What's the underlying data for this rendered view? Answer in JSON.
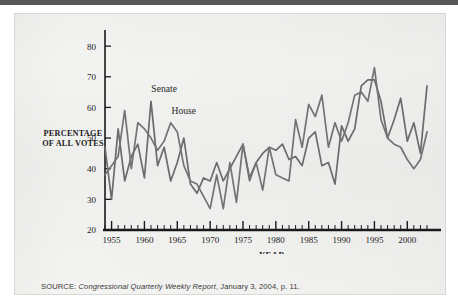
{
  "figure": {
    "y_axis_label_line1": "PERCENTAGE",
    "y_axis_label_line2": "OF ALL VOTES",
    "x_axis_title": "YEAR",
    "source_label": "SOURCE:",
    "source_publication": "Congressional Quarterly Weekly Report",
    "source_rest": ", January 3, 2004, p. 11.",
    "colors": {
      "senate_line": "#6b6b6b",
      "house_line": "#737373",
      "axis": "#1b1b1b",
      "paper": "#f3f3f1",
      "top_bar": "#575757"
    }
  },
  "chart_data": {
    "type": "line",
    "title": "",
    "xlabel": "YEAR",
    "ylabel": "PERCENTAGE OF ALL VOTES",
    "xlim": [
      1954,
      2003
    ],
    "ylim": [
      20,
      82
    ],
    "yticks": [
      20,
      30,
      40,
      50,
      60,
      70,
      80
    ],
    "xticks": [
      1955,
      1960,
      1965,
      1970,
      1975,
      1980,
      1985,
      1990,
      1995,
      2000
    ],
    "minor_xtick_interval": 1,
    "grid": false,
    "legend": "inline-labels",
    "annotations": [
      {
        "text": "Senate",
        "x": 1963,
        "y": 65
      },
      {
        "text": "House",
        "x": 1966,
        "y": 58
      }
    ],
    "x": [
      1954,
      1955,
      1956,
      1957,
      1958,
      1959,
      1960,
      1961,
      1962,
      1963,
      1964,
      1965,
      1966,
      1967,
      1968,
      1969,
      1970,
      1971,
      1972,
      1973,
      1974,
      1975,
      1976,
      1977,
      1978,
      1979,
      1980,
      1981,
      1982,
      1983,
      1984,
      1985,
      1986,
      1987,
      1988,
      1989,
      1990,
      1991,
      1992,
      1993,
      1994,
      1995,
      1996,
      1997,
      1998,
      1999,
      2000,
      2001,
      2002,
      2003
    ],
    "series": [
      {
        "name": "Senate",
        "color": "#6b6b6b",
        "values": [
          47,
          30,
          53,
          36,
          44,
          48,
          37,
          62,
          41,
          47,
          36,
          42,
          50,
          35,
          32,
          37,
          36,
          42,
          36,
          40,
          44,
          48,
          37,
          42,
          45,
          47,
          46,
          48,
          43,
          44,
          41,
          50,
          52,
          41,
          42,
          35,
          54,
          49,
          53,
          67,
          69,
          69,
          62,
          50,
          56,
          63,
          49,
          55,
          45,
          67
        ]
      },
      {
        "name": "House",
        "color": "#737373",
        "values": [
          38,
          41,
          44,
          59,
          40,
          55,
          53,
          50,
          46,
          49,
          55,
          52,
          41,
          36,
          35,
          31,
          27,
          38,
          27,
          42,
          29,
          48,
          36,
          42,
          33,
          47,
          38,
          37,
          36,
          56,
          47,
          61,
          57,
          64,
          47,
          55,
          49,
          55,
          64,
          65,
          62,
          73,
          56,
          50,
          48,
          47,
          43,
          40,
          43,
          52
        ]
      }
    ]
  }
}
